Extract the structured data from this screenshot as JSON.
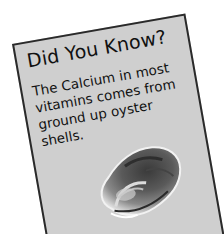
{
  "card": {
    "title": "Did You Know?",
    "body": "The Calcium in most vitamins comes from ground up oyster shells.",
    "image": "oyster-shell",
    "background_color": "#cfcfcf",
    "border_color": "#2a2a2a"
  }
}
